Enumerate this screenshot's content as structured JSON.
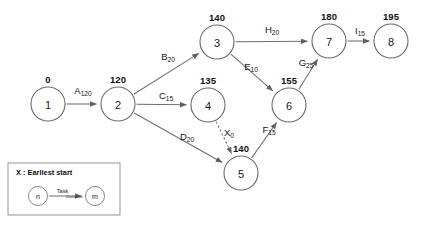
{
  "diagram": {
    "type": "activity-on-arrow-network",
    "title_text": "",
    "nodes": [
      {
        "id": "1",
        "label": "1",
        "earliest_start": "0",
        "cx": 48,
        "cy": 104,
        "r": 17
      },
      {
        "id": "2",
        "label": "2",
        "earliest_start": "120",
        "cx": 118,
        "cy": 104,
        "r": 17
      },
      {
        "id": "3",
        "label": "3",
        "earliest_start": "140",
        "cx": 217,
        "cy": 42,
        "r": 17
      },
      {
        "id": "4",
        "label": "4",
        "earliest_start": "135",
        "cx": 208,
        "cy": 105,
        "r": 17
      },
      {
        "id": "5",
        "label": "5",
        "earliest_start": "140",
        "cx": 241,
        "cy": 173,
        "r": 17
      },
      {
        "id": "6",
        "label": "6",
        "earliest_start": "155",
        "cx": 289,
        "cy": 105,
        "r": 17
      },
      {
        "id": "7",
        "label": "7",
        "earliest_start": "180",
        "cx": 329,
        "cy": 41,
        "r": 17
      },
      {
        "id": "8",
        "label": "8",
        "earliest_start": "195",
        "cx": 391,
        "cy": 41,
        "r": 17
      }
    ],
    "edges": [
      {
        "name": "A",
        "duration": "120",
        "from": "1",
        "to": "2",
        "dummy": false,
        "label_x": 83,
        "label_y": 94
      },
      {
        "name": "B",
        "duration": "20",
        "from": "2",
        "to": "3",
        "dummy": false,
        "label_x": 168,
        "label_y": 60
      },
      {
        "name": "C",
        "duration": "15",
        "from": "2",
        "to": "4",
        "dummy": false,
        "label_x": 166,
        "label_y": 99
      },
      {
        "name": "D",
        "duration": "20",
        "from": "2",
        "to": "5",
        "dummy": false,
        "label_x": 187,
        "label_y": 140
      },
      {
        "name": "X",
        "duration": "0",
        "from": "4",
        "to": "5",
        "dummy": true,
        "label_x": 229,
        "label_y": 136
      },
      {
        "name": "E",
        "duration": "10",
        "from": "3",
        "to": "6",
        "dummy": false,
        "label_x": 251,
        "label_y": 70
      },
      {
        "name": "F",
        "duration": "15",
        "from": "5",
        "to": "6",
        "dummy": false,
        "label_x": 269,
        "label_y": 133
      },
      {
        "name": "G",
        "duration": "25",
        "from": "6",
        "to": "7",
        "dummy": false,
        "label_x": 306,
        "label_y": 66
      },
      {
        "name": "H",
        "duration": "20",
        "from": "3",
        "to": "7",
        "dummy": false,
        "label_x": 272,
        "label_y": 33
      },
      {
        "name": "I",
        "duration": "15",
        "from": "7",
        "to": "8",
        "dummy": false,
        "label_x": 360,
        "label_y": 34
      }
    ]
  },
  "legend": {
    "title": "X : Earliest start",
    "from_node_label": "n",
    "to_node_label": "m",
    "task_label": "Task",
    "duration_label": "Duration",
    "box": {
      "x": 8,
      "y": 163,
      "width": 112,
      "height": 52
    }
  },
  "colors": {
    "background": "#ffffff",
    "stroke": "#6e6e6e",
    "text": "#141414"
  }
}
